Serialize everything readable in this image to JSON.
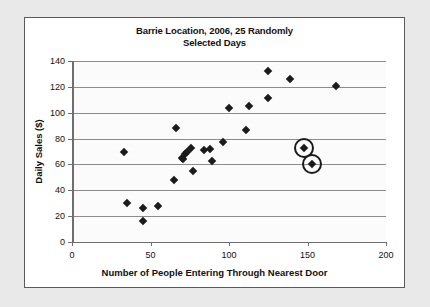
{
  "chart_data": {
    "type": "scatter",
    "title": "Barrie Location, 2006, 25 Randomly Selected Days",
    "title_line1": "Barrie Location, 2006, 25 Randomly",
    "title_line2": "Selected Days",
    "xlabel": "Number of People Entering Through Nearest Door",
    "ylabel": "Daily Sales ($)",
    "xlim": [
      0,
      200
    ],
    "ylim": [
      0,
      140
    ],
    "xticks": [
      0,
      50,
      100,
      150,
      200
    ],
    "yticks": [
      0,
      20,
      40,
      60,
      80,
      100,
      120,
      140
    ],
    "grid": "horizontal",
    "legend": "none",
    "marker": "diamond",
    "marker_color": "#1b1b1b",
    "points": [
      {
        "x": 33,
        "y": 70
      },
      {
        "x": 35,
        "y": 30
      },
      {
        "x": 45,
        "y": 26
      },
      {
        "x": 45,
        "y": 16
      },
      {
        "x": 55,
        "y": 28
      },
      {
        "x": 65,
        "y": 48
      },
      {
        "x": 66,
        "y": 88
      },
      {
        "x": 70,
        "y": 65
      },
      {
        "x": 71,
        "y": 64
      },
      {
        "x": 72,
        "y": 68
      },
      {
        "x": 73,
        "y": 70
      },
      {
        "x": 76,
        "y": 73
      },
      {
        "x": 77,
        "y": 55
      },
      {
        "x": 84,
        "y": 71
      },
      {
        "x": 88,
        "y": 72
      },
      {
        "x": 89,
        "y": 63
      },
      {
        "x": 96,
        "y": 77
      },
      {
        "x": 100,
        "y": 104
      },
      {
        "x": 111,
        "y": 87
      },
      {
        "x": 113,
        "y": 105
      },
      {
        "x": 125,
        "y": 111
      },
      {
        "x": 125,
        "y": 132
      },
      {
        "x": 139,
        "y": 126
      },
      {
        "x": 148,
        "y": 73
      },
      {
        "x": 153,
        "y": 60
      },
      {
        "x": 168,
        "y": 121
      }
    ],
    "highlighted_points": [
      {
        "x": 148,
        "y": 73
      },
      {
        "x": 153,
        "y": 60
      }
    ]
  }
}
